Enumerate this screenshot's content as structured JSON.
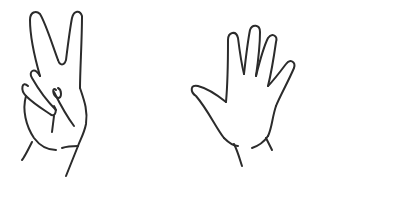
{
  "puzzle": {
    "terms": [
      {
        "kind": "hand",
        "gesture": "peace-sign",
        "fingers_shown": 2
      },
      {
        "kind": "operator",
        "symbol": "+"
      },
      {
        "kind": "hand",
        "gesture": "open-palm",
        "fingers_shown": 5
      },
      {
        "kind": "operator",
        "symbol": "="
      }
    ],
    "answer": ""
  },
  "colors": {
    "ink": "#222222",
    "background": "#ffffff"
  }
}
